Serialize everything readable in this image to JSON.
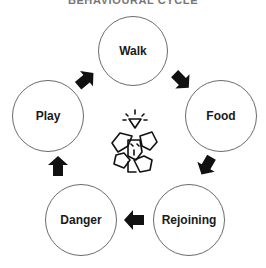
{
  "title": "BEHAVIOURAL CYCLE",
  "title_note": "partially cropped at top edge; reading inferred from letter shapes",
  "center_icon": "dog-with-lightbulb-icon",
  "nodes": [
    {
      "label": "Walk"
    },
    {
      "label": "Food"
    },
    {
      "label": "Rejoining"
    },
    {
      "label": "Danger"
    },
    {
      "label": "Play"
    }
  ],
  "flow": [
    "Walk",
    "Food",
    "Rejoining",
    "Danger",
    "Play",
    "Walk"
  ]
}
